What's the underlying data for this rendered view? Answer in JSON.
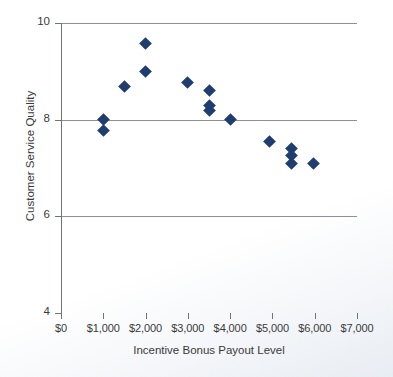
{
  "chart_data": {
    "type": "scatter",
    "title": "",
    "xlabel": "Incentive Bonus Payout Level",
    "ylabel": "Customer Service Quality",
    "xlim": [
      0,
      7000
    ],
    "ylim": [
      4,
      10
    ],
    "grid": true,
    "legend": null,
    "x_ticks": [
      0,
      1000,
      2000,
      3000,
      4000,
      5000,
      6000,
      7000
    ],
    "x_tick_labels": [
      "$0",
      "$1,000",
      "$2,000",
      "$3,000",
      "$4,000",
      "$5,000",
      "$6,000",
      "$7,000"
    ],
    "y_ticks": [
      4,
      6,
      8,
      10
    ],
    "y_tick_labels": [
      "4",
      "6",
      "8",
      "10"
    ],
    "gridline_values": [
      6,
      8,
      10
    ],
    "marker": "diamond",
    "marker_color": "#1f3d6e",
    "points": [
      {
        "x": 1000,
        "y": 8.0
      },
      {
        "x": 1000,
        "y": 7.77
      },
      {
        "x": 1500,
        "y": 8.68
      },
      {
        "x": 2000,
        "y": 9.57
      },
      {
        "x": 2000,
        "y": 9.0
      },
      {
        "x": 3000,
        "y": 8.77
      },
      {
        "x": 3500,
        "y": 8.6
      },
      {
        "x": 3500,
        "y": 8.3
      },
      {
        "x": 3500,
        "y": 8.2
      },
      {
        "x": 4000,
        "y": 8.0
      },
      {
        "x": 4920,
        "y": 7.55
      },
      {
        "x": 5440,
        "y": 7.4
      },
      {
        "x": 5440,
        "y": 7.25
      },
      {
        "x": 5440,
        "y": 7.1
      },
      {
        "x": 5980,
        "y": 7.1
      }
    ]
  },
  "colors": {
    "marker": "#1f3d6e",
    "gridline": "#8d9196",
    "axis": "#6f7479",
    "text": "#3a3a3a"
  }
}
